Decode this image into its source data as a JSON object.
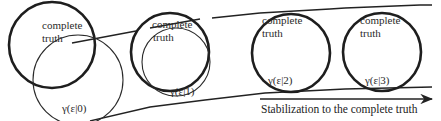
{
  "diagram": {
    "stages": [
      {
        "truth_label_line1": "complete",
        "truth_label_line2": "truth",
        "gamma_label": "γ(ε|0)"
      },
      {
        "truth_label_line1": "complete",
        "truth_label_line2": "truth",
        "gamma_label": "γ(ε|1)"
      },
      {
        "truth_label_line1": "complete",
        "truth_label_line2": "truth",
        "gamma_label": "γ(ε|2)"
      },
      {
        "truth_label_line1": "complete",
        "truth_label_line2": "truth",
        "gamma_label": "γ(ε|3)"
      }
    ],
    "arrow_caption": "Stabilization to the complete truth"
  }
}
